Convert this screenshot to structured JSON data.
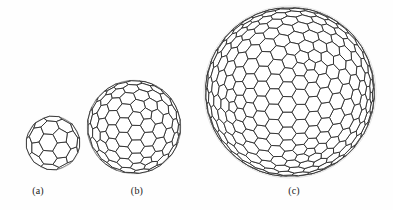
{
  "figure": {
    "background_color": "#fefefe",
    "line_color_front": "#2b2b2b",
    "line_color_back": "#a8a8a8",
    "panels": [
      {
        "id": "a",
        "caption": "(a)",
        "structure": "truncated-icosahedron-fullerene-cage",
        "relative_size": "smallest",
        "rendering": "wireframe polyhedron, solid near edges, dashed far edges",
        "geometry": {
          "shell_count": 1,
          "face_types": [
            "pentagon",
            "hexagon"
          ],
          "center_face": "pentagon",
          "cx": 29,
          "cy": 33,
          "radius": 27,
          "rings": 3
        }
      },
      {
        "id": "b",
        "caption": "(b)",
        "structure": "fullerene-cage",
        "relative_size": "medium",
        "rendering": "wireframe polyhedron, solid near edges, dashed far edges",
        "geometry": {
          "shell_count": 1,
          "face_types": [
            "pentagon",
            "hexagon"
          ],
          "center_face": "pentagon",
          "cx": 49,
          "cy": 55,
          "radius": 47,
          "rings": 5
        }
      },
      {
        "id": "c",
        "caption": "(c)",
        "structure": "fullerene-cage",
        "relative_size": "largest",
        "rendering": "wireframe polyhedron with faceted icosahedral profile, solid near edges, dashed far edges",
        "geometry": {
          "shell_count": 1,
          "face_types": [
            "pentagon",
            "hexagon"
          ],
          "center_face": "hexagon",
          "cx": 88,
          "cy": 90,
          "radius": 86,
          "rings": 8
        }
      }
    ]
  }
}
